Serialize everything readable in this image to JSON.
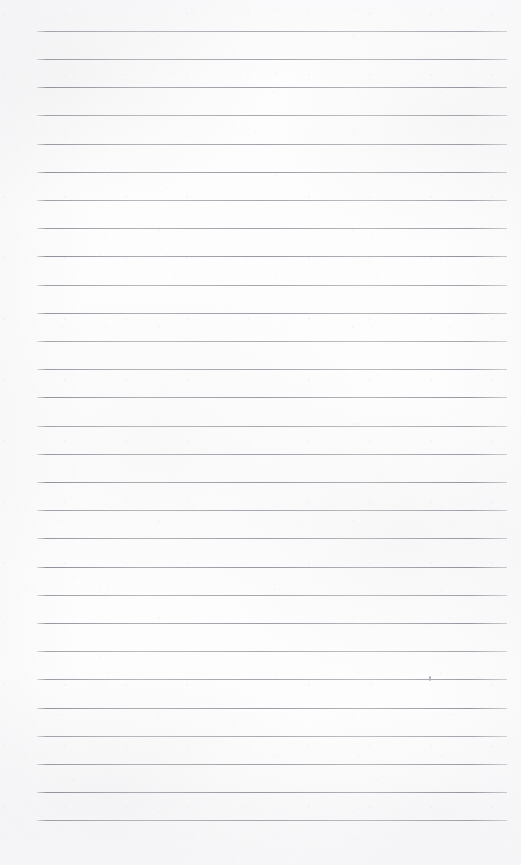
{
  "document": {
    "kind": "scanned-lined-paper",
    "title": "Blank ruled notebook page",
    "page_width": 521,
    "page_height": 865,
    "paper_color": "#fdfdfd",
    "rule_color": "#8e8e99",
    "text_content": "",
    "is_blank": true
  },
  "ruling": {
    "line_count": 29,
    "first_line_y": 31,
    "line_spacing": 28.2,
    "line_start_x": 37,
    "line_end_x": 507,
    "line_thickness": 1,
    "lines_y": [
      31,
      59,
      87,
      115,
      144,
      172,
      200,
      228,
      256,
      285,
      313,
      341,
      369,
      397,
      426,
      454,
      482,
      510,
      538,
      567,
      595,
      623,
      651,
      679,
      708,
      736,
      764,
      792,
      820
    ]
  },
  "marks": [
    {
      "name": "faint-pencil-dot",
      "x": 429,
      "y": 676,
      "width": 2,
      "height": 5,
      "color": "#b2b2b8"
    }
  ]
}
